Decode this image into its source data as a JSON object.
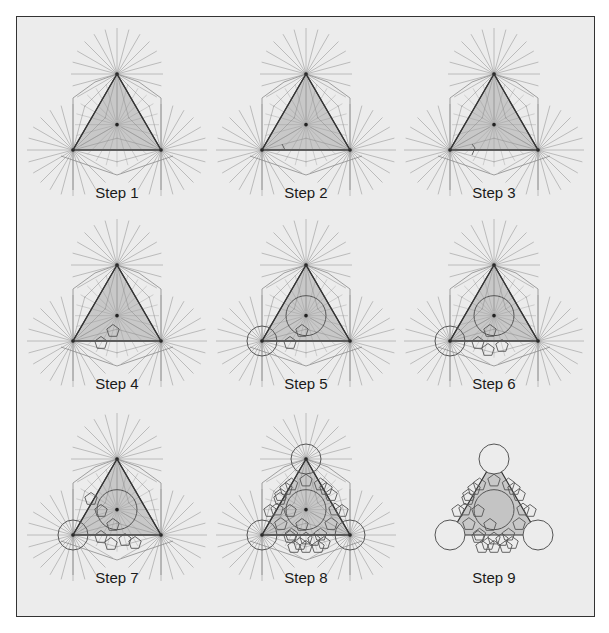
{
  "figure": {
    "background": "#ececec",
    "frame_color": "#333333",
    "triangle_fill": "#c8c8c8",
    "ray_color": "#8a8a8a",
    "line_color": "#555555",
    "edge_color": "#333333"
  },
  "panels": [
    {
      "label": "Step 1",
      "step": 1,
      "cx": 117,
      "top": 74,
      "features": {
        "rays": true,
        "center_circle": false,
        "corner_circles": [],
        "tiles": 0
      }
    },
    {
      "label": "Step 2",
      "step": 2,
      "cx": 306,
      "top": 74,
      "features": {
        "rays": true,
        "center_circle": false,
        "corner_circles": [],
        "tiles": 0,
        "tick": true
      }
    },
    {
      "label": "Step 3",
      "step": 3,
      "cx": 494,
      "top": 74,
      "features": {
        "rays": true,
        "center_circle": false,
        "corner_circles": [],
        "tiles": 0,
        "tick2": true
      }
    },
    {
      "label": "Step 4",
      "step": 4,
      "cx": 117,
      "top": 265,
      "features": {
        "rays": true,
        "center_circle": false,
        "corner_circles": [],
        "tiles": 1
      }
    },
    {
      "label": "Step 5",
      "step": 5,
      "cx": 306,
      "top": 265,
      "features": {
        "rays": true,
        "center_circle": true,
        "corner_circles": [
          "bl"
        ],
        "tiles": 1
      }
    },
    {
      "label": "Step 6",
      "step": 6,
      "cx": 494,
      "top": 265,
      "features": {
        "rays": true,
        "center_circle": true,
        "corner_circles": [
          "bl"
        ],
        "tiles": 2
      }
    },
    {
      "label": "Step 7",
      "step": 7,
      "cx": 117,
      "top": 459,
      "features": {
        "rays": true,
        "center_circle": true,
        "corner_circles": [
          "bl"
        ],
        "tiles": 3
      }
    },
    {
      "label": "Step 8",
      "step": 8,
      "cx": 306,
      "top": 459,
      "features": {
        "rays": true,
        "center_circle": true,
        "corner_circles": [
          "bl",
          "br",
          "top"
        ],
        "tiles": 4
      }
    },
    {
      "label": "Step 9",
      "step": 9,
      "cx": 494,
      "top": 459,
      "features": {
        "rays": false,
        "center_circle": true,
        "corner_circles": [
          "bl",
          "br",
          "top"
        ],
        "tiles": 4,
        "final": true
      }
    }
  ],
  "geometry": {
    "half_width": 44,
    "height": 76,
    "ray_count": 24,
    "ray_length": 46,
    "center_radius": 20,
    "corner_radius": 15,
    "label_offset_y": 112
  }
}
